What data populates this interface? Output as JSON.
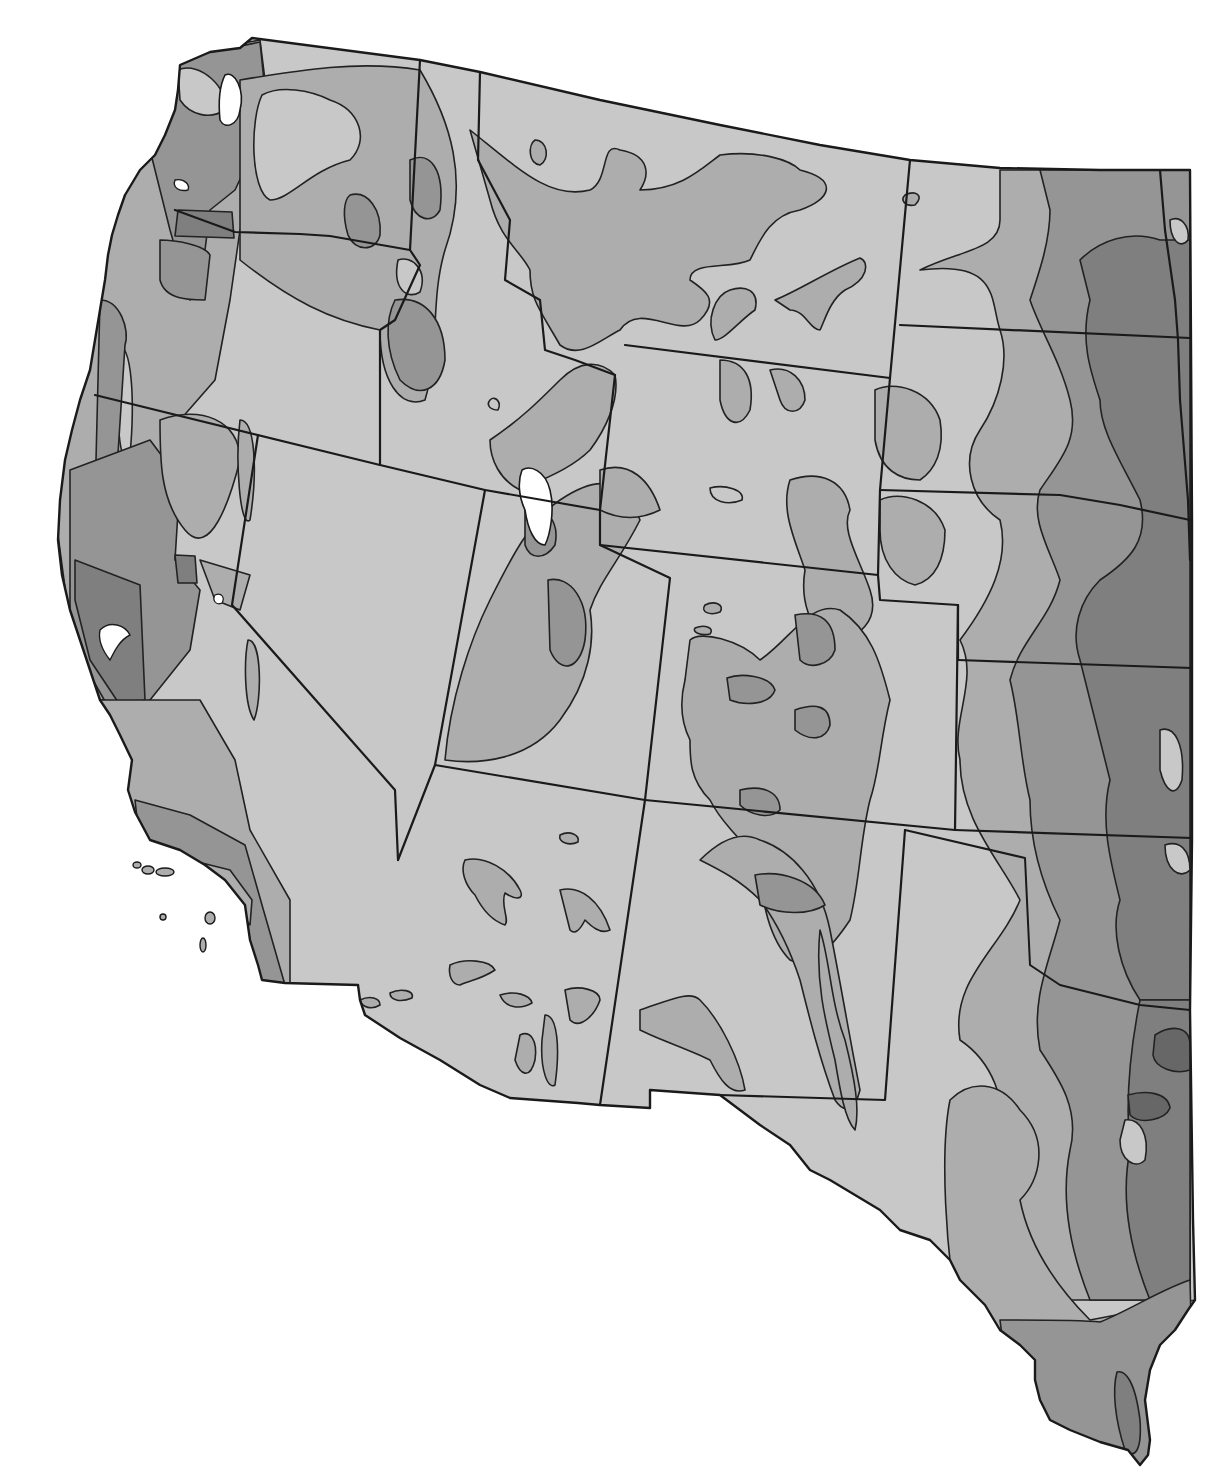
{
  "map": {
    "title": "",
    "type": "choropleth-isoline",
    "region": "Western United States",
    "labels": [],
    "palette": {
      "background": "#ffffff",
      "water": "#ffffff",
      "level_1_lightest": "#c8c8c8",
      "level_2": "#adadad",
      "level_3": "#959595",
      "level_4": "#7f7f7f",
      "level_5_darkest": "#676767",
      "boundary": "#1a1a1a"
    },
    "shade_levels": 5,
    "states_shown": [
      "Washington",
      "Oregon",
      "California",
      "Idaho",
      "Nevada",
      "Montana",
      "Wyoming",
      "Utah",
      "Colorado",
      "Arizona",
      "New Mexico",
      "North Dakota",
      "South Dakota",
      "Nebraska",
      "Kansas",
      "Oklahoma",
      "Texas"
    ],
    "legend": null
  }
}
